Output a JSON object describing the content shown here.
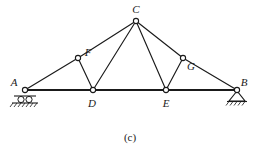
{
  "figure": {
    "caption": "(c)",
    "line_color": "#1a1a1a",
    "background_color": "#ffffff",
    "joint_fill": "#ffffff"
  },
  "nodes": [
    {
      "id": "A",
      "label": "A",
      "x": 25,
      "y": 90,
      "label_x": 14,
      "label_y": 86,
      "support": "roller"
    },
    {
      "id": "B",
      "label": "B",
      "x": 237,
      "y": 90,
      "label_x": 243,
      "label_y": 86,
      "support": "pin"
    },
    {
      "id": "C",
      "label": "C",
      "x": 136,
      "y": 21,
      "label_x": 133,
      "label_y": 12,
      "support": "none"
    },
    {
      "id": "D",
      "label": "D",
      "x": 93,
      "y": 90,
      "label_x": 89,
      "label_y": 105,
      "support": "none"
    },
    {
      "id": "E",
      "label": "E",
      "x": 166,
      "y": 90,
      "label_x": 163,
      "label_y": 105,
      "support": "none"
    },
    {
      "id": "F",
      "label": "F",
      "x": 78,
      "y": 58,
      "label_x": 85,
      "label_y": 55,
      "support": "none"
    },
    {
      "id": "G",
      "label": "G",
      "x": 183,
      "y": 58,
      "label_x": 188,
      "label_y": 68,
      "support": "none"
    }
  ],
  "members": [
    {
      "from": "A",
      "to": "F",
      "kind": "chord"
    },
    {
      "from": "F",
      "to": "C",
      "kind": "chord"
    },
    {
      "from": "C",
      "to": "G",
      "kind": "chord"
    },
    {
      "from": "G",
      "to": "B",
      "kind": "chord"
    },
    {
      "from": "F",
      "to": "D",
      "kind": "web"
    },
    {
      "from": "D",
      "to": "C",
      "kind": "web"
    },
    {
      "from": "C",
      "to": "E",
      "kind": "web"
    },
    {
      "from": "E",
      "to": "G",
      "kind": "web"
    }
  ],
  "bottom_chord": {
    "from": "A",
    "to": "B",
    "kind": "chord-bottom"
  },
  "supports": {
    "left": {
      "type": "roller",
      "node": "A",
      "roller_count": 2
    },
    "right": {
      "type": "pin",
      "node": "B"
    }
  }
}
